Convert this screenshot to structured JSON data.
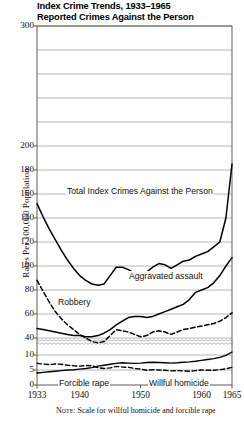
{
  "title": {
    "line1": "Index Crime Trends, 1933–1965",
    "line2": "Reported Crimes Against the Person"
  },
  "axes": {
    "ylabel": "Rates Per 100,000 Population",
    "xlabel": ""
  },
  "note": {
    "keyword": "Note:",
    "text": "Scale for willful homicide and forcible rape"
  },
  "series_labels": {
    "total": "Total Index Crimes Against the Person",
    "aggravated_assault": "Aggravated assault",
    "robbery": "Robbery",
    "forcible_rape": "Forcible rape",
    "willful_homicide": "Willful homicide"
  },
  "colors": {
    "line": "#000000",
    "grid": "#9a9a9a",
    "frame": "#4a4a4a",
    "background": "#ffffff"
  },
  "chart_data": {
    "type": "line",
    "xlabel": "",
    "ylabel": "Rates Per 100,000 Population",
    "grid": true,
    "legend": "inline-annotations",
    "xlim": [
      1933,
      1965
    ],
    "x_ticks": [
      1933,
      1940,
      1950,
      1960,
      1965
    ],
    "upper_panel": {
      "ylim": [
        40,
        300
      ],
      "y_ticks": [
        40,
        60,
        80,
        100,
        120,
        140,
        160,
        180,
        200,
        220,
        240,
        260,
        280,
        300
      ],
      "y_tick_labels": [
        "40",
        "60",
        "80",
        "100",
        "120",
        "140",
        "160",
        "180",
        "200",
        "",
        "",
        "",
        "",
        "300"
      ]
    },
    "lower_panel": {
      "ylim": [
        0,
        13
      ],
      "y_ticks": [
        0,
        5,
        10
      ],
      "y_tick_labels": [
        "0",
        "5",
        "10"
      ],
      "axis_break": true
    },
    "x": [
      1933,
      1934,
      1935,
      1936,
      1937,
      1938,
      1939,
      1940,
      1941,
      1942,
      1943,
      1944,
      1945,
      1946,
      1947,
      1948,
      1949,
      1950,
      1951,
      1952,
      1953,
      1954,
      1955,
      1956,
      1957,
      1958,
      1959,
      1960,
      1961,
      1962,
      1963,
      1964,
      1965
    ],
    "series": [
      {
        "name": "Total Index Crimes Against the Person",
        "style": "solid",
        "panel": "upper",
        "values": [
          152,
          141,
          131,
          122,
          113,
          105,
          98,
          92,
          88,
          85,
          84,
          85,
          92,
          99,
          99,
          97,
          94,
          92,
          95,
          99,
          102,
          101,
          98,
          101,
          104,
          105,
          108,
          110,
          112,
          116,
          120,
          140,
          185
        ]
      },
      {
        "name": "Robbery",
        "style": "dashed",
        "panel": "upper",
        "values": [
          88,
          79,
          70,
          62,
          56,
          51,
          47,
          43,
          40,
          37,
          36,
          37,
          42,
          47,
          46,
          45,
          43,
          41,
          42,
          45,
          46,
          45,
          43,
          45,
          47,
          48,
          49,
          50,
          51,
          52,
          54,
          57,
          61
        ]
      },
      {
        "name": "Aggravated assault",
        "style": "solid",
        "panel": "upper",
        "values": [
          48,
          47,
          46,
          45,
          44,
          43,
          42,
          42,
          41,
          41,
          42,
          44,
          47,
          51,
          54,
          57,
          58,
          58,
          57,
          58,
          60,
          62,
          64,
          66,
          68,
          72,
          78,
          80,
          82,
          86,
          92,
          100,
          107
        ]
      },
      {
        "name": "Forcible rape",
        "style": "solid",
        "panel": "lower",
        "values": [
          4.0,
          4.2,
          4.4,
          4.6,
          4.8,
          5.0,
          5.1,
          5.3,
          5.5,
          5.8,
          6.3,
          6.6,
          6.9,
          7.2,
          7.4,
          7.3,
          7.2,
          7.3,
          7.5,
          7.6,
          7.5,
          7.4,
          7.3,
          7.4,
          7.6,
          7.7,
          7.9,
          8.2,
          8.5,
          8.8,
          9.2,
          9.9,
          11.0
        ]
      },
      {
        "name": "Willful homicide",
        "style": "dashed",
        "panel": "lower",
        "values": [
          7.2,
          7.0,
          6.8,
          7.0,
          6.9,
          6.6,
          6.4,
          6.3,
          6.5,
          6.4,
          5.8,
          5.5,
          5.7,
          6.2,
          6.0,
          5.9,
          5.5,
          5.3,
          4.9,
          5.1,
          5.0,
          4.9,
          4.7,
          4.8,
          4.7,
          4.6,
          4.8,
          5.0,
          4.9,
          4.9,
          5.1,
          5.4,
          5.9
        ]
      }
    ]
  }
}
